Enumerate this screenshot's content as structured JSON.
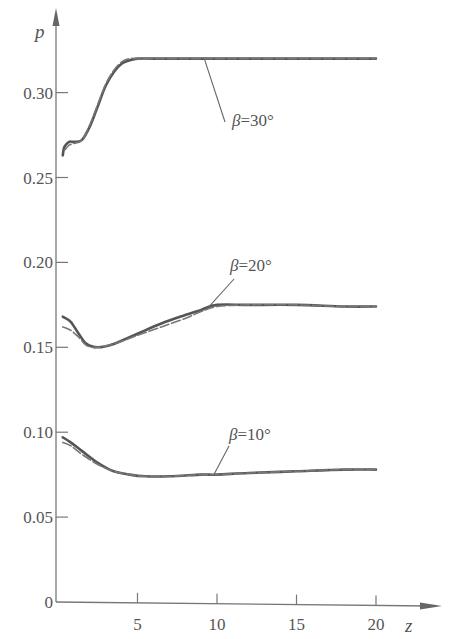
{
  "chart_data": {
    "type": "line",
    "title": "",
    "xlabel": "z",
    "ylabel": "p",
    "xlim": [
      0,
      22
    ],
    "ylim": [
      0,
      0.35
    ],
    "grid": false,
    "legend": "none (curves labeled inline with leader lines)",
    "x_ticks": [
      {
        "value": 5,
        "label": "5"
      },
      {
        "value": 10,
        "label": "10"
      },
      {
        "value": 15,
        "label": "15"
      },
      {
        "value": 20,
        "label": "20"
      }
    ],
    "y_ticks": [
      {
        "value": 0,
        "label": "0"
      },
      {
        "value": 0.05,
        "label": "0.05"
      },
      {
        "value": 0.1,
        "label": "0.10"
      },
      {
        "value": 0.15,
        "label": "0.15"
      },
      {
        "value": 0.2,
        "label": "0.20"
      },
      {
        "value": 0.25,
        "label": "0.25"
      },
      {
        "value": 0.3,
        "label": "0.30"
      }
    ],
    "series": [
      {
        "name": "β=30°",
        "style": "solid",
        "x": [
          0.3,
          0.4,
          0.7,
          1.0,
          1.5,
          2.0,
          2.5,
          3.0,
          3.5,
          4.0,
          4.5,
          5.0,
          6.0,
          8.0,
          10.0,
          12.0,
          15.0,
          18.0,
          20.0
        ],
        "y": [
          0.263,
          0.268,
          0.271,
          0.271,
          0.272,
          0.28,
          0.292,
          0.304,
          0.312,
          0.317,
          0.319,
          0.32,
          0.32,
          0.32,
          0.32,
          0.32,
          0.32,
          0.32,
          0.32
        ]
      },
      {
        "name": "β=30° (dashed)",
        "style": "dashed",
        "x": [
          0.4,
          0.7,
          1.0,
          1.5,
          2.0,
          2.5,
          3.0,
          3.5,
          4.0,
          4.5,
          5.0,
          6.0,
          8.0,
          10.0,
          12.0,
          15.0,
          18.0,
          20.0
        ],
        "y": [
          0.266,
          0.269,
          0.27,
          0.272,
          0.281,
          0.293,
          0.305,
          0.313,
          0.318,
          0.32,
          0.32,
          0.32,
          0.32,
          0.32,
          0.32,
          0.32,
          0.32,
          0.32
        ]
      },
      {
        "name": "β=20°",
        "style": "solid",
        "x": [
          0.3,
          0.8,
          1.3,
          1.8,
          2.5,
          3.5,
          5.0,
          6.5,
          8.0,
          9.0,
          10.0,
          12.0,
          15.0,
          18.0,
          20.0
        ],
        "y": [
          0.168,
          0.165,
          0.158,
          0.152,
          0.15,
          0.152,
          0.158,
          0.164,
          0.169,
          0.172,
          0.175,
          0.175,
          0.175,
          0.174,
          0.174
        ]
      },
      {
        "name": "β=20° (dashed)",
        "style": "dashed",
        "x": [
          0.3,
          0.8,
          1.3,
          1.8,
          2.5,
          3.5,
          5.0,
          6.5,
          8.0,
          9.0,
          10.0,
          12.0,
          15.0,
          18.0,
          20.0
        ],
        "y": [
          0.162,
          0.16,
          0.156,
          0.151,
          0.15,
          0.152,
          0.157,
          0.162,
          0.167,
          0.171,
          0.174,
          0.175,
          0.175,
          0.174,
          0.174
        ]
      },
      {
        "name": "β=10°",
        "style": "solid",
        "x": [
          0.3,
          0.8,
          1.5,
          2.5,
          3.5,
          4.5,
          5.5,
          7.0,
          9.0,
          10.0,
          12.0,
          15.0,
          18.0,
          20.0
        ],
        "y": [
          0.097,
          0.094,
          0.089,
          0.082,
          0.077,
          0.075,
          0.074,
          0.074,
          0.075,
          0.075,
          0.076,
          0.077,
          0.078,
          0.078
        ]
      },
      {
        "name": "β=10° (dashed)",
        "style": "dashed",
        "x": [
          0.3,
          0.8,
          1.5,
          2.5,
          3.5,
          4.5,
          5.5,
          7.0,
          9.0,
          10.0,
          12.0,
          15.0,
          18.0,
          20.0
        ],
        "y": [
          0.094,
          0.092,
          0.087,
          0.081,
          0.077,
          0.075,
          0.074,
          0.074,
          0.075,
          0.075,
          0.076,
          0.077,
          0.078,
          0.078
        ]
      }
    ],
    "annotations": [
      {
        "text": "β=30°",
        "beta": "β",
        "rest": "=30°",
        "leader_from_z": 9.2,
        "leader_from_p": 0.32
      },
      {
        "text": "β=20°",
        "beta": "β",
        "rest": "=20°",
        "leader_from_z": 9.5,
        "leader_from_p": 0.174
      },
      {
        "text": "β=10°",
        "beta": "β",
        "rest": "=10°",
        "leader_from_z": 9.8,
        "leader_from_p": 0.075
      }
    ]
  },
  "axes": {
    "x_name": "z",
    "y_name": "p"
  },
  "colors": {
    "ink": "#555555",
    "axis": "#777777",
    "background": "#ffffff"
  }
}
